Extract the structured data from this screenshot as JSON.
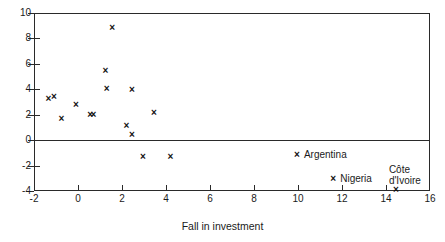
{
  "figure": {
    "title_fragment": "",
    "xaxis_title": "Fall in investment"
  },
  "chart_data": {
    "type": "scatter",
    "title": "",
    "xlabel": "Fall in investment",
    "ylabel": "",
    "xlim": [
      -2,
      16
    ],
    "ylim": [
      -4,
      10
    ],
    "xticks": [
      -2,
      0,
      2,
      4,
      6,
      8,
      10,
      12,
      14,
      16
    ],
    "yticks": [
      -4,
      -2,
      0,
      2,
      4,
      6,
      8,
      10
    ],
    "xtick_labels": [
      "-2",
      "0",
      "2",
      "4",
      "6",
      "8",
      "10",
      "12",
      "14",
      "16"
    ],
    "ytick_labels": [
      "-4",
      "-2",
      "0",
      "2",
      "4",
      "6",
      "8",
      "10"
    ],
    "grid": false,
    "legend": false,
    "reference_lines": [
      {
        "axis": "y",
        "value": 0
      }
    ],
    "marker": "x",
    "points": [
      {
        "x": -1.35,
        "y": 3.3,
        "label": ""
      },
      {
        "x": -1.1,
        "y": 3.45,
        "label": ""
      },
      {
        "x": -0.75,
        "y": 1.7,
        "label": ""
      },
      {
        "x": -0.1,
        "y": 2.8,
        "label": ""
      },
      {
        "x": 0.55,
        "y": 2.05,
        "label": ""
      },
      {
        "x": 0.7,
        "y": 2.0,
        "label": ""
      },
      {
        "x": 1.25,
        "y": 5.5,
        "label": ""
      },
      {
        "x": 1.3,
        "y": 4.05,
        "label": ""
      },
      {
        "x": 1.55,
        "y": 8.85,
        "label": ""
      },
      {
        "x": 2.2,
        "y": 1.15,
        "label": ""
      },
      {
        "x": 2.45,
        "y": 4.0,
        "label": ""
      },
      {
        "x": 2.45,
        "y": 0.45,
        "label": ""
      },
      {
        "x": 2.95,
        "y": -1.3,
        "label": ""
      },
      {
        "x": 3.45,
        "y": 2.15,
        "label": ""
      },
      {
        "x": 4.2,
        "y": -1.25,
        "label": ""
      },
      {
        "x": 9.95,
        "y": -1.15,
        "label": "Argentina"
      },
      {
        "x": 11.6,
        "y": -3.05,
        "label": "Nigeria"
      },
      {
        "x": 14.45,
        "y": -3.85,
        "label": "Côte d'Ivoire"
      }
    ]
  },
  "annotations": [
    {
      "text": "Argentina",
      "lines": [
        "Argentina"
      ]
    },
    {
      "text": "Nigeria",
      "lines": [
        "Nigeria"
      ]
    },
    {
      "text": "Côte d'Ivoire",
      "lines": [
        "Côte",
        "d'Ivoire"
      ]
    }
  ]
}
